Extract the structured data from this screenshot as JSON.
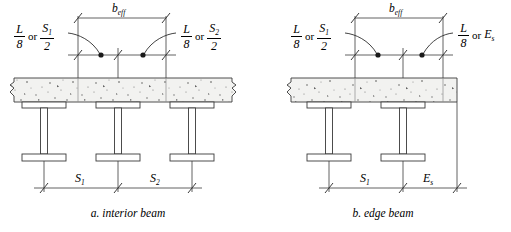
{
  "figure": {
    "background_color": "#ffffff",
    "line_color": "#3a3a3a",
    "slab_fill_color": "#f2f2f0",
    "stipple_color": "#555555"
  },
  "panels": [
    {
      "id": "interior-beam",
      "caption": "a. interior beam",
      "top_dimension": {
        "label_main": "b",
        "label_sub": "eff"
      },
      "left_label": {
        "fraction_1": {
          "numerator": "L",
          "denominator": "8"
        },
        "connector": "or",
        "fraction_2": {
          "numerator_main": "S",
          "numerator_sub": "1",
          "denominator": "2"
        }
      },
      "right_label": {
        "fraction_1": {
          "numerator": "L",
          "denominator": "8"
        },
        "connector": "or",
        "fraction_2": {
          "numerator_main": "S",
          "numerator_sub": "2",
          "denominator": "2"
        }
      },
      "bottom_dimensions": [
        {
          "label_main": "S",
          "label_sub": "1"
        },
        {
          "label_main": "S",
          "label_sub": "2"
        }
      ],
      "beam_count": 3
    },
    {
      "id": "edge-beam",
      "caption": "b. edge beam",
      "top_dimension": {
        "label_main": "b",
        "label_sub": "eff"
      },
      "left_label": {
        "fraction_1": {
          "numerator": "L",
          "denominator": "8"
        },
        "connector": "or",
        "fraction_2": {
          "numerator_main": "S",
          "numerator_sub": "1",
          "denominator": "2"
        }
      },
      "right_label": {
        "fraction_1": {
          "numerator": "L",
          "denominator": "8"
        },
        "connector": "or",
        "term_main": "E",
        "term_sub": "s"
      },
      "bottom_dimensions": [
        {
          "label_main": "S",
          "label_sub": "1"
        },
        {
          "label_main": "E",
          "label_sub": "s"
        }
      ],
      "beam_count": 2
    }
  ]
}
